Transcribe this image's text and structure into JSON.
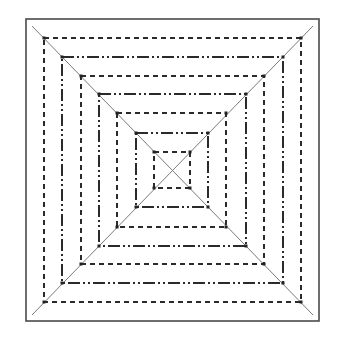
{
  "diagram": {
    "type": "concentric-squares-with-diagonals",
    "width": 341,
    "height": 348,
    "background": "#ffffff",
    "frame": {
      "x1": 26,
      "y1": 19,
      "x2": 319,
      "y2": 321,
      "color": "#4a4a4a",
      "stroke_width": 1.6
    },
    "diagonals": [
      {
        "name": "diagonal-top-left-to-bottom-right",
        "x1": 32,
        "y1": 26,
        "x2": 313,
        "y2": 315
      },
      {
        "name": "diagonal-top-right-to-bottom-left",
        "x1": 313,
        "y1": 26,
        "x2": 32,
        "y2": 315
      }
    ],
    "diagonal_style": {
      "color": "#7a7a7a",
      "stroke_width": 1
    },
    "line_styles": {
      "dashed": {
        "dasharray": "5 4",
        "color": "#2a2a2a",
        "stroke_width": 2
      },
      "dash-dot-dot": {
        "dasharray": "12 3 2 3 2 3",
        "color": "#2a2a2a",
        "stroke_width": 2
      }
    },
    "squares": [
      {
        "index": 1,
        "style": "dashed",
        "x1": 44,
        "y1": 38,
        "x2": 301,
        "y2": 302
      },
      {
        "index": 2,
        "style": "dash-dot-dot",
        "x1": 62,
        "y1": 57,
        "x2": 283,
        "y2": 283
      },
      {
        "index": 3,
        "style": "dashed",
        "x1": 81,
        "y1": 76,
        "x2": 264,
        "y2": 264
      },
      {
        "index": 4,
        "style": "dash-dot-dot",
        "x1": 99,
        "y1": 94,
        "x2": 246,
        "y2": 246
      },
      {
        "index": 5,
        "style": "dashed",
        "x1": 117,
        "y1": 113,
        "x2": 226,
        "y2": 227
      },
      {
        "index": 6,
        "style": "dash-dot-dot",
        "x1": 136,
        "y1": 133,
        "x2": 208,
        "y2": 207
      },
      {
        "index": 7,
        "style": "dashed",
        "x1": 154,
        "y1": 152,
        "x2": 190,
        "y2": 188
      }
    ],
    "corner_marker": {
      "size": 3,
      "color": "#222222"
    }
  }
}
